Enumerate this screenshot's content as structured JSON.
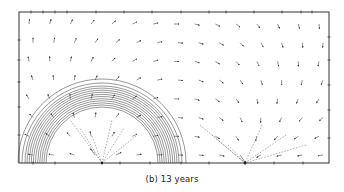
{
  "figure": {
    "caption": "(b) 13 years",
    "frame": {
      "x0": 19,
      "y0": 12,
      "x1": 329,
      "y1": 163
    },
    "source": {
      "x": 102,
      "y": 163,
      "label": "injection well"
    },
    "sink": {
      "x": 245,
      "y": 163,
      "label": "production well"
    },
    "front": {
      "inner_radius": 56,
      "outer_radius": 77,
      "band_count": 11,
      "extra_outer_radii": [
        80,
        84
      ]
    },
    "colors": {
      "line": "#333333",
      "arrow": "#444444",
      "background": "#ffffff"
    },
    "grid": {
      "cols": 15,
      "rows": 8
    },
    "ticks": {
      "top": [
        31,
        43,
        55,
        67,
        96,
        124,
        152,
        181,
        209,
        226,
        254,
        282,
        301,
        312
      ],
      "right": [
        37,
        60,
        85,
        110,
        138
      ],
      "left": [
        40,
        60,
        82,
        107,
        135
      ],
      "bottom": [
        33,
        55,
        102,
        120,
        150,
        181,
        209,
        245,
        274,
        303
      ]
    }
  }
}
